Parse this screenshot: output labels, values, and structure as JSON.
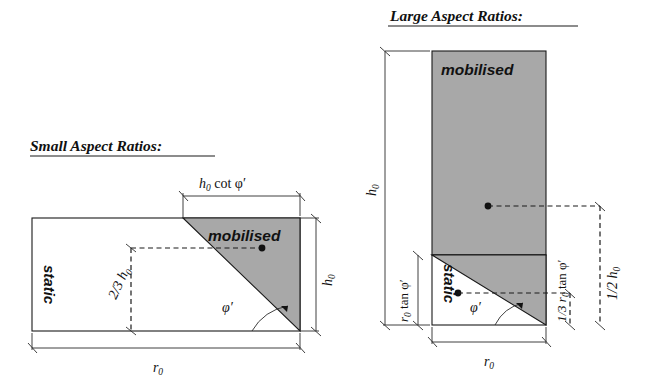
{
  "figure": {
    "type": "engineering-diagram",
    "background_color": "#ffffff",
    "line_color": "#1a1a1a",
    "fill_gray": "#a8a8a8"
  },
  "panels": [
    {
      "id": "small-aspect-ratios",
      "title": "Small Aspect Ratios:",
      "region_labels": {
        "mobilised": "mobilised",
        "static": "static"
      },
      "angle_label": "φ′",
      "dimensions": [
        {
          "name": "top-width",
          "text": "h",
          "sub": "0",
          "rest": " cot φ′",
          "full": "h₀ cot φ′",
          "orientation": "horizontal"
        },
        {
          "name": "right-height",
          "text": "h",
          "sub": "0",
          "rest": "",
          "full": "h₀",
          "orientation": "vertical"
        },
        {
          "name": "centroid-height",
          "text": "2/3 h",
          "sub": "0",
          "rest": "",
          "full": "2/3 h₀",
          "orientation": "vertical"
        },
        {
          "name": "base-width",
          "text": "r",
          "sub": "0",
          "rest": "",
          "full": "r₀",
          "orientation": "horizontal"
        }
      ]
    },
    {
      "id": "large-aspect-ratios",
      "title": "Large Aspect Ratios:",
      "region_labels": {
        "mobilised": "mobilised",
        "static": "static"
      },
      "angle_label": "φ′",
      "dimensions": [
        {
          "name": "left-height",
          "text": "h",
          "sub": "0",
          "rest": "",
          "full": "h₀",
          "orientation": "vertical"
        },
        {
          "name": "wedge-height",
          "text": "r",
          "sub": "0",
          "rest": " tan φ′",
          "full": "r₀ tan φ′",
          "orientation": "vertical"
        },
        {
          "name": "wedge-centroid-height",
          "text": "1/3 r",
          "sub": "0",
          "rest": " tan φ′",
          "full": "1/3 r₀ tan φ′",
          "orientation": "vertical"
        },
        {
          "name": "block-centroid-height",
          "text": "1/2 h",
          "sub": "0",
          "rest": "",
          "full": "1/2 h₀",
          "orientation": "vertical"
        },
        {
          "name": "base-width",
          "text": "r",
          "sub": "0",
          "rest": "",
          "full": "r₀",
          "orientation": "horizontal"
        }
      ]
    }
  ]
}
